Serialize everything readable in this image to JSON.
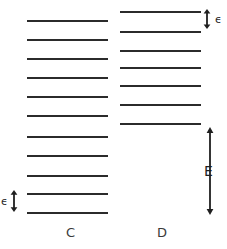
{
  "figure": {
    "width": 227,
    "height": 249,
    "background": "#ffffff",
    "line_color": "#2b2b2b",
    "annotation_color": "#1f1f1f"
  },
  "chart_data": {
    "type": "line",
    "title": "",
    "xlabel": "",
    "ylabel": "",
    "columns": [
      {
        "label": "C",
        "name": "column-c",
        "x_start": 27,
        "x_end": 108,
        "level_count": 11,
        "level_y": [
          20,
          39,
          58,
          77,
          96,
          115,
          136,
          155,
          175,
          193,
          212
        ],
        "spacing": 19
      },
      {
        "label": "D",
        "name": "column-d",
        "x_start": 120,
        "x_end": 201,
        "level_count": 7,
        "level_y": [
          11,
          31,
          50,
          67,
          85,
          104,
          123
        ],
        "spacing": 19
      }
    ],
    "annotations": [
      {
        "name": "epsilon-top-right",
        "symbol": "ϵ",
        "meaning": "level spacing in column D",
        "arrow_x": 207,
        "arrow_top": 9,
        "arrow_bottom": 29,
        "label_x": 215,
        "label_y": 14
      },
      {
        "name": "epsilon-bottom-left",
        "symbol": "ϵ",
        "meaning": "level spacing in column C",
        "arrow_x": 14,
        "arrow_top": 190,
        "arrow_bottom": 212,
        "label_x": 1,
        "label_y": 196
      },
      {
        "name": "energy-gap-e",
        "symbol": "E",
        "meaning": "total energy gap below lowest level of column D",
        "arrow_x": 210,
        "arrow_top": 127,
        "arrow_bottom": 215,
        "label_x": 204,
        "label_y": 164
      }
    ],
    "labels": [
      {
        "text": "C",
        "x": 66,
        "y": 226
      },
      {
        "text": "D",
        "x": 157,
        "y": 226
      }
    ]
  }
}
